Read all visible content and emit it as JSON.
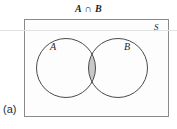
{
  "figure": {
    "title": "A ∩ B",
    "part_label": "(a)",
    "caption_letter": "a",
    "width_px": 177,
    "height_px": 129
  },
  "diagram": {
    "type": "venn-two-set",
    "universe": {
      "label": "S",
      "shape": "rectangle",
      "x": 24,
      "y": 19,
      "width": 145,
      "height": 98,
      "fill_color": "#fdfdfd",
      "stroke_color": "#8a8a8a",
      "stroke_width": 1
    },
    "sets": [
      {
        "label": "A",
        "shape": "circle",
        "cx": 66,
        "cy": 68,
        "r": 29.5,
        "fill_color": "#ffffff",
        "stroke_color": "#4a4a4a",
        "stroke_width": 1
      },
      {
        "label": "B",
        "shape": "circle",
        "cx": 118,
        "cy": 68,
        "r": 29.5,
        "fill_color": "#ffffff",
        "stroke_color": "#4a4a4a",
        "stroke_width": 1
      }
    ],
    "shaded_region": {
      "name": "intersection",
      "set_expression": "A ∩ B",
      "fill_color": "#c9c9c9",
      "stroke_color": "#6d6d6d"
    },
    "colors": {
      "page_background": "#ffffff",
      "universe_fill": "#fdfdfd",
      "universe_border": "#8a8a8a",
      "circle_outline": "#4a4a4a",
      "shading": "#c9c9c9",
      "text": "#1f1f1f",
      "scan_artifact": "#e3e3e3"
    }
  }
}
